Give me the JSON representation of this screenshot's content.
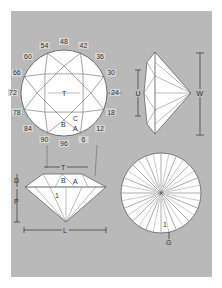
{
  "colors": {
    "background": "#b9b9b9",
    "facet": "#ffffff",
    "line": "#555555",
    "text": "#333333"
  },
  "top_view": {
    "table_label": "T",
    "facet_labels": {
      "C": "C",
      "B": "B",
      "A": "A"
    },
    "angle_labels": [
      "48",
      "42",
      "36",
      "30",
      "24",
      "18",
      "12",
      "6",
      "96",
      "90",
      "84",
      "78",
      "72",
      "66",
      "60",
      "54"
    ]
  },
  "side_view": {
    "u_label": "U",
    "w_label": "W"
  },
  "profile_view": {
    "t_label": "T",
    "b_label": "B",
    "a_label": "A",
    "one_label": "1",
    "d_label": "D",
    "p_label": "P",
    "l_label": "L"
  },
  "bottom_view": {
    "one_label": "1",
    "g_label": "G"
  }
}
